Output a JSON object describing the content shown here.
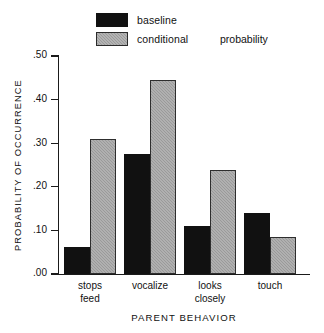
{
  "chart_data": {
    "type": "bar",
    "title": "",
    "xlabel": "PARENT BEHAVIOR",
    "ylabel": "PROBABILITY OF OCCURRENCE",
    "categories": [
      "stops\nfeed",
      "vocalize",
      "looks\nclosely",
      "touch"
    ],
    "category_lines": [
      [
        "stops",
        "feed"
      ],
      [
        "vocalize",
        ""
      ],
      [
        "looks",
        "closely"
      ],
      [
        "touch",
        ""
      ]
    ],
    "series": [
      {
        "name": "baseline",
        "color": "#111111",
        "values": [
          0.062,
          0.276,
          0.111,
          0.14
        ]
      },
      {
        "name": "conditional",
        "color": "#9a9a9a",
        "values": [
          0.309,
          0.445,
          0.239,
          0.085
        ]
      }
    ],
    "ylim": [
      0.0,
      0.5
    ],
    "yticks": [
      0.0,
      0.1,
      0.2,
      0.3,
      0.4,
      0.5
    ],
    "ytick_labels": [
      ".00",
      ".10",
      ".20",
      ".30",
      ".40",
      ".50"
    ],
    "grid": false,
    "legend_position": "top-center",
    "legend_extra_text": "probability"
  }
}
